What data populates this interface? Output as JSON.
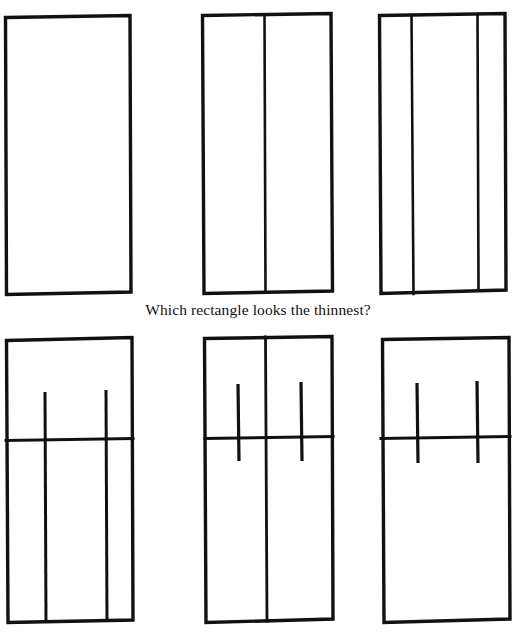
{
  "figure": {
    "caption": "Which rectangle looks the thinnest?",
    "background_color": "#ffffff",
    "stroke_color": "#111111",
    "style": "hand-drawn ink line illustration",
    "rows": [
      {
        "row_name": "top-row",
        "panels": [
          {
            "id": "panel-top-left",
            "label": "plain rectangle",
            "outline": {
              "x": 5,
              "y": 16,
              "width": 126,
              "height": 278
            },
            "vertical_dividers": [],
            "horizontal_dividers": [],
            "short_strokes": []
          },
          {
            "id": "panel-top-middle",
            "label": "rectangle with one vertical divider",
            "outline": {
              "x": 202,
              "y": 13,
              "width": 130,
              "height": 280
            },
            "vertical_dividers": [
              264
            ],
            "horizontal_dividers": [],
            "short_strokes": []
          },
          {
            "id": "panel-top-right",
            "label": "rectangle with two vertical dividers",
            "outline": {
              "x": 379,
              "y": 13,
              "width": 127,
              "height": 280
            },
            "vertical_dividers": [
              412,
              478
            ],
            "horizontal_dividers": [],
            "short_strokes": []
          }
        ]
      },
      {
        "row_name": "bottom-row",
        "panels": [
          {
            "id": "panel-bottom-left",
            "label": "rectangle with horizontal divider and two long vertical strokes",
            "outline": {
              "x": 6,
              "y": 338,
              "width": 127,
              "height": 284
            },
            "vertical_dividers": [],
            "horizontal_dividers": [
              440
            ],
            "short_strokes": [
              {
                "x": 45,
                "y1": 392,
                "y2": 622
              },
              {
                "x": 106,
                "y1": 390,
                "y2": 622
              }
            ]
          },
          {
            "id": "panel-bottom-middle",
            "label": "rectangle with central vertical divider, horizontal divider and two short crossing strokes",
            "outline": {
              "x": 203,
              "y": 336,
              "width": 130,
              "height": 286
            },
            "vertical_dividers": [
              266
            ],
            "horizontal_dividers": [
              437
            ],
            "short_strokes": [
              {
                "x": 238,
                "y1": 384,
                "y2": 461
              },
              {
                "x": 301,
                "y1": 382,
                "y2": 461
              }
            ]
          },
          {
            "id": "panel-bottom-right",
            "label": "rectangle with horizontal divider and two short crossing strokes",
            "outline": {
              "x": 381,
              "y": 338,
              "width": 129,
              "height": 284
            },
            "vertical_dividers": [],
            "horizontal_dividers": [
              437
            ],
            "short_strokes": [
              {
                "x": 417,
                "y1": 383,
                "y2": 463
              },
              {
                "x": 477,
                "y1": 381,
                "y2": 463
              }
            ]
          }
        ]
      }
    ]
  }
}
